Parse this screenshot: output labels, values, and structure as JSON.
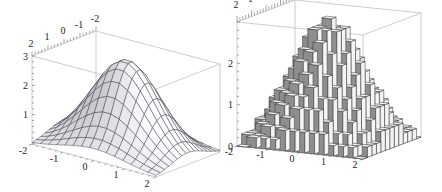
{
  "chart_data": [
    {
      "type": "surface",
      "title": "",
      "function": "3*exp(-(x^2+y^2)/2)",
      "x_range": [
        -2,
        2
      ],
      "y_range": [
        -2,
        2
      ],
      "z_range": [
        0,
        3
      ],
      "mesh_lines": 15,
      "x_ticks": [
        "-2",
        "-1",
        "0",
        "1",
        "2"
      ],
      "y_ticks": [
        "2",
        "1",
        "0",
        "-1",
        "-2"
      ],
      "z_ticks": [
        "1",
        "2",
        "3"
      ],
      "peak_value": 3,
      "surface_color": "#f2f2f4",
      "mesh_color": "#3a3a44",
      "box_color": "#b8b8b8"
    },
    {
      "type": "bar3d",
      "title": "",
      "function": "3*exp(-(x^2+y^2)/2)",
      "x_range": [
        -2,
        2
      ],
      "y_range": [
        -2,
        2
      ],
      "z_range": [
        0,
        3
      ],
      "bins": 13,
      "x_ticks": [
        "-2",
        "-1",
        "0",
        "1",
        "2"
      ],
      "y_ticks": [
        "2",
        "1",
        "0",
        "-1",
        "-2"
      ],
      "z_ticks": [
        "0",
        "1",
        "2"
      ],
      "bar_front_color": "#8e8e8e",
      "bar_side_color": "#f4f4f4",
      "bar_top_color": "#f7f7f7",
      "edge_color": "#333333",
      "box_color": "#b8b8b8"
    }
  ]
}
